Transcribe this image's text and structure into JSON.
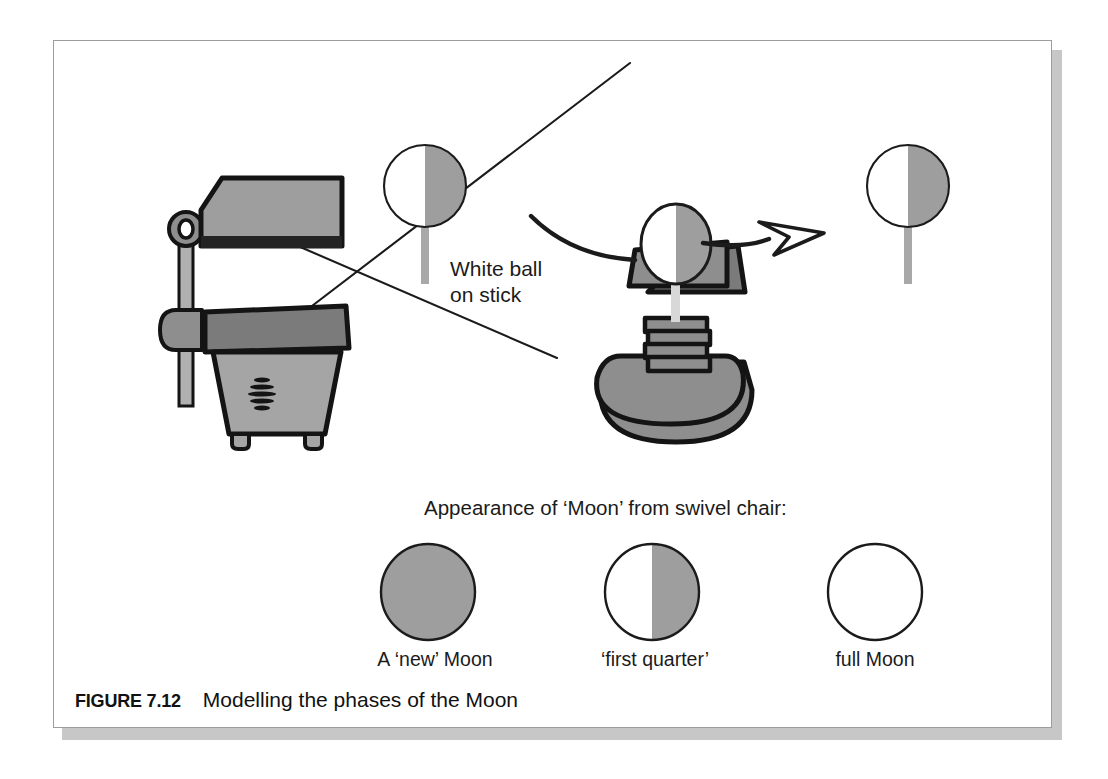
{
  "figure": {
    "number_label": "FIGURE 7.12",
    "caption": "Modelling the phases of the Moon"
  },
  "annotations": {
    "white_ball_label": "White ball\non stick",
    "appearance_heading": "Appearance of ‘Moon’ from swivel chair:"
  },
  "objects": {
    "projector_name": "overhead projector",
    "chair_name": "swivel chair",
    "rotation_arrow_name": "rotation arrow"
  },
  "balls": [
    {
      "id": "ball-left",
      "lit_side": "left",
      "shaded_side": "right"
    },
    {
      "id": "ball-right",
      "lit_side": "left",
      "shaded_side": "right"
    },
    {
      "id": "ball-on-chair",
      "lit_side": "left",
      "shaded_side": "right"
    }
  ],
  "phases": [
    {
      "id": "new-moon",
      "caption": "A ‘new’ Moon",
      "appearance": "fully shaded"
    },
    {
      "id": "first-quarter",
      "caption": "‘first quarter’",
      "appearance": "half lit, lit on left"
    },
    {
      "id": "full-moon",
      "caption": "full Moon",
      "appearance": "fully lit"
    }
  ],
  "colors": {
    "ink": "#1b1b1b",
    "outline": "#141414",
    "shade_gray": "#9e9e9e",
    "mid_gray": "#8e8e8e",
    "dark_gray": "#7b7b7b",
    "light_gray": "#b3b3b3",
    "paper": "#ffffff",
    "frame": "#9d9d9d",
    "shadow": "#c7c7c7"
  }
}
